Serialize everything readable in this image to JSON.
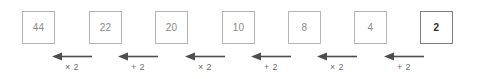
{
  "diagram": {
    "type": "reverse-operation-flow",
    "direction": "right-to-left",
    "nodes": [
      {
        "id": "node-1",
        "value": "44",
        "emphasis": false,
        "x": 22,
        "y": 11
      },
      {
        "id": "node-2",
        "value": "22",
        "emphasis": false,
        "x": 89,
        "y": 11
      },
      {
        "id": "node-3",
        "value": "20",
        "emphasis": false,
        "x": 155,
        "y": 11
      },
      {
        "id": "node-4",
        "value": "10",
        "emphasis": false,
        "x": 222,
        "y": 11
      },
      {
        "id": "node-5",
        "value": "8",
        "emphasis": false,
        "x": 288,
        "y": 11
      },
      {
        "id": "node-6",
        "value": "4",
        "emphasis": false,
        "x": 354,
        "y": 11
      },
      {
        "id": "node-7",
        "value": "2",
        "emphasis": true,
        "x": 420,
        "y": 11
      }
    ],
    "edges": [
      {
        "id": "edge-1",
        "label": "× 2",
        "icon": "arrow-left-icon",
        "from": "node-2",
        "to": "node-1",
        "x": 52,
        "y": 52,
        "width": 40
      },
      {
        "id": "edge-2",
        "label": "+ 2",
        "icon": "arrow-left-icon",
        "from": "node-3",
        "to": "node-2",
        "x": 118,
        "y": 52,
        "width": 40
      },
      {
        "id": "edge-3",
        "label": "× 2",
        "icon": "arrow-left-icon",
        "from": "node-4",
        "to": "node-3",
        "x": 185,
        "y": 52,
        "width": 40
      },
      {
        "id": "edge-4",
        "label": "+ 2",
        "icon": "arrow-left-icon",
        "from": "node-5",
        "to": "node-4",
        "x": 251,
        "y": 52,
        "width": 40
      },
      {
        "id": "edge-5",
        "label": "× 2",
        "icon": "arrow-left-icon",
        "from": "node-6",
        "to": "node-5",
        "x": 317,
        "y": 52,
        "width": 40
      },
      {
        "id": "edge-6",
        "label": "+ 2",
        "icon": "arrow-left-icon",
        "from": "node-7",
        "to": "node-6",
        "x": 384,
        "y": 52,
        "width": 40
      }
    ],
    "colors": {
      "box_border": "#b4b4b4",
      "box_border_emphasis": "#7d7d7d",
      "node_text": "#8a8a8a",
      "node_text_emphasis": "#2b2b2b",
      "edge_label_text": "#6e6e6e",
      "arrow": "#4d4d4d",
      "background": "#ffffff"
    }
  }
}
